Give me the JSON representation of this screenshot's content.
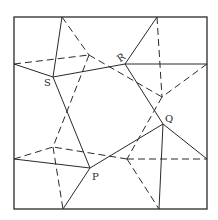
{
  "diagram": {
    "title": "",
    "labels": {
      "P": "P",
      "Q": "Q",
      "R": "R",
      "S": "S"
    },
    "points": {
      "P": [
        90,
        168
      ],
      "Q": [
        163,
        124
      ],
      "R": [
        125,
        64
      ],
      "S": [
        53,
        77
      ]
    },
    "colors": {
      "line": "#2a2a2a",
      "background": "#ffffff"
    }
  }
}
